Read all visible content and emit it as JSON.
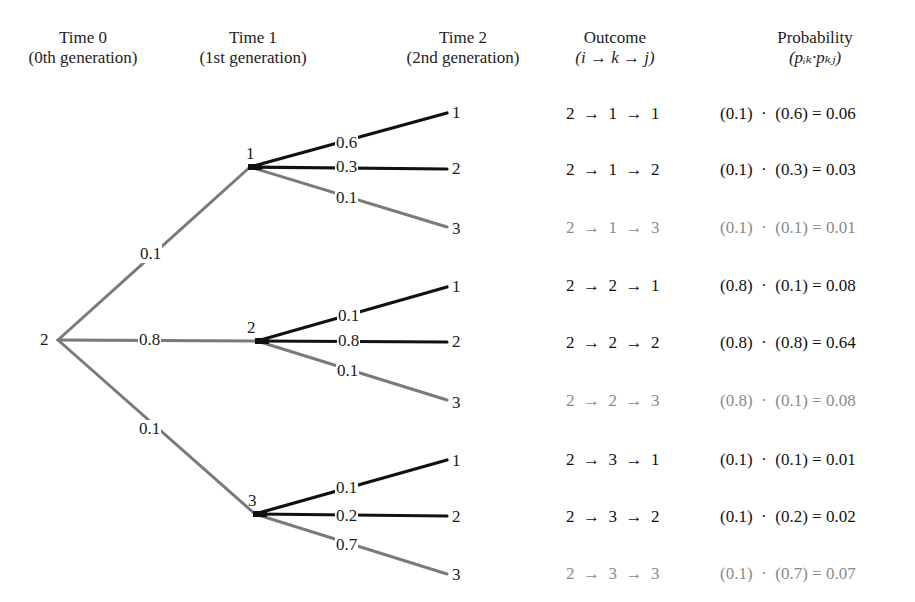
{
  "headers": [
    {
      "line1": "Time 0",
      "line2": "(0th generation)"
    },
    {
      "line1": "Time 1",
      "line2": "(1st generation)"
    },
    {
      "line1": "Time 2",
      "line2": "(2nd generation)"
    },
    {
      "line1": "Outcome",
      "line2": "(i → k → j)"
    },
    {
      "line1": "Probability",
      "line2": "(pᵢₖ·pₖⱼ)"
    }
  ],
  "colors": {
    "dark": "#111111",
    "gray": "#7a7a7a",
    "light_text": "#8a8a8a"
  },
  "root": {
    "label": "2"
  },
  "first_gen": [
    {
      "state": "1",
      "prob": "0.1"
    },
    {
      "state": "2",
      "prob": "0.8"
    },
    {
      "state": "3",
      "prob": "0.1"
    }
  ],
  "second_gen": [
    [
      {
        "state": "1",
        "prob": "0.6"
      },
      {
        "state": "2",
        "prob": "0.3"
      },
      {
        "state": "3",
        "prob": "0.1"
      }
    ],
    [
      {
        "state": "1",
        "prob": "0.1"
      },
      {
        "state": "2",
        "prob": "0.8"
      },
      {
        "state": "3",
        "prob": "0.1"
      }
    ],
    [
      {
        "state": "1",
        "prob": "0.1"
      },
      {
        "state": "2",
        "prob": "0.2"
      },
      {
        "state": "3",
        "prob": "0.7"
      }
    ]
  ],
  "rows": [
    {
      "outcome": "2  →  1  →  1",
      "probability": "(0.1)  ·  (0.6) = 0.06",
      "style": "dark"
    },
    {
      "outcome": "2  →  1  →  2",
      "probability": "(0.1)  ·  (0.3) = 0.03",
      "style": "dark"
    },
    {
      "outcome": "2  →  1  →  3",
      "probability": "(0.1)  ·  (0.1) = 0.01",
      "style": "light"
    },
    {
      "outcome": "2  →  2  →  1",
      "probability": "(0.8)  ·  (0.1) = 0.08",
      "style": "dark"
    },
    {
      "outcome": "2  →  2  →  2",
      "probability": "(0.8)  ·  (0.8) = 0.64",
      "style": "dark"
    },
    {
      "outcome": "2  →  2  →  3",
      "probability": "(0.8)  ·  (0.1) = 0.08",
      "style": "light"
    },
    {
      "outcome": "2  →  3  →  1",
      "probability": "(0.1)  ·  (0.1) = 0.01",
      "style": "dark"
    },
    {
      "outcome": "2  →  3  →  2",
      "probability": "(0.1)  ·  (0.2) = 0.02",
      "style": "dark"
    },
    {
      "outcome": "2  →  3  →  3",
      "probability": "(0.1)  ·  (0.7) = 0.07",
      "style": "light"
    }
  ]
}
